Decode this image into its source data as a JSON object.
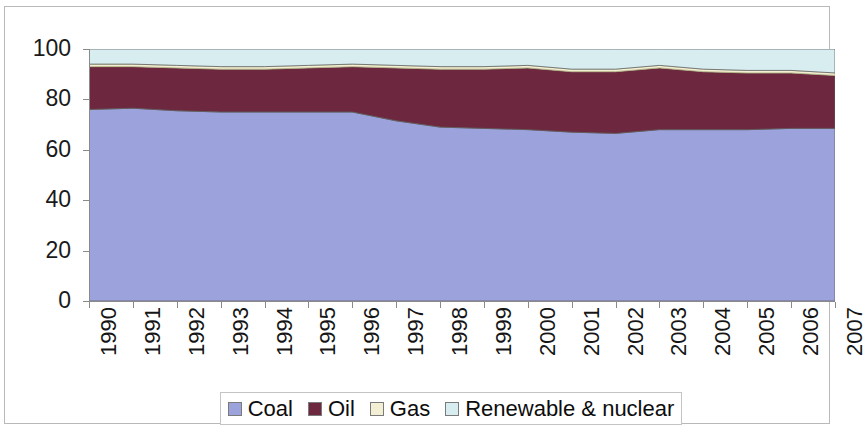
{
  "chart_data": {
    "type": "area",
    "stacked": true,
    "title": "",
    "xlabel": "",
    "ylabel": "",
    "ylim": [
      0,
      100
    ],
    "yticks": [
      0,
      20,
      40,
      60,
      80,
      100
    ],
    "grid": false,
    "legend_position": "bottom",
    "categories": [
      "1990",
      "1991",
      "1992",
      "1993",
      "1994",
      "1995",
      "1996",
      "1997",
      "1998",
      "1999",
      "2000",
      "2001",
      "2002",
      "2003",
      "2004",
      "2005",
      "2006",
      "2007"
    ],
    "series": [
      {
        "name": "Coal",
        "color": "#9ca2dc",
        "values": [
          76.0,
          76.5,
          75.5,
          75.0,
          75.0,
          75.0,
          75.0,
          71.5,
          69.0,
          68.5,
          68.0,
          67.0,
          66.5,
          68.0,
          68.0,
          68.0,
          68.5,
          68.5
        ]
      },
      {
        "name": "Oil",
        "color": "#6d2840",
        "values": [
          17.0,
          16.5,
          17.0,
          17.0,
          17.0,
          17.5,
          18.0,
          21.0,
          23.0,
          23.5,
          24.5,
          24.0,
          24.5,
          24.5,
          23.0,
          22.5,
          22.0,
          21.0
        ]
      },
      {
        "name": "Gas",
        "color": "#f2efd4",
        "values": [
          1.0,
          1.0,
          1.0,
          1.0,
          1.0,
          1.0,
          1.0,
          1.0,
          1.0,
          1.0,
          1.0,
          1.0,
          1.0,
          1.0,
          1.0,
          1.0,
          1.0,
          1.0
        ]
      },
      {
        "name": "Renewable & nuclear",
        "color": "#d8edf0",
        "values": [
          6.0,
          6.0,
          6.5,
          7.0,
          7.0,
          6.5,
          6.0,
          6.5,
          7.0,
          7.0,
          6.5,
          8.0,
          8.0,
          6.5,
          8.0,
          8.5,
          8.5,
          9.5
        ]
      }
    ]
  },
  "axes": {
    "y_tick_labels": [
      "100",
      "80",
      "60",
      "40",
      "20",
      "0"
    ],
    "x_tick_labels": [
      "1990",
      "1991",
      "1992",
      "1993",
      "1994",
      "1995",
      "1996",
      "1997",
      "1998",
      "1999",
      "2000",
      "2001",
      "2002",
      "2003",
      "2004",
      "2005",
      "2006",
      "2007"
    ]
  },
  "legend": {
    "items": [
      {
        "label": "Coal",
        "color": "#9ca2dc"
      },
      {
        "label": "Oil",
        "color": "#6d2840"
      },
      {
        "label": "Gas",
        "color": "#f2efd4"
      },
      {
        "label": "Renewable & nuclear",
        "color": "#d8edf0"
      }
    ]
  },
  "colors": {
    "coal": "#9ca2dc",
    "oil": "#6d2840",
    "gas": "#f2efd4",
    "renewable_nuclear": "#d8edf0",
    "axis": "#8a8a8a",
    "text": "#141414",
    "border": "#b9b9b9"
  }
}
